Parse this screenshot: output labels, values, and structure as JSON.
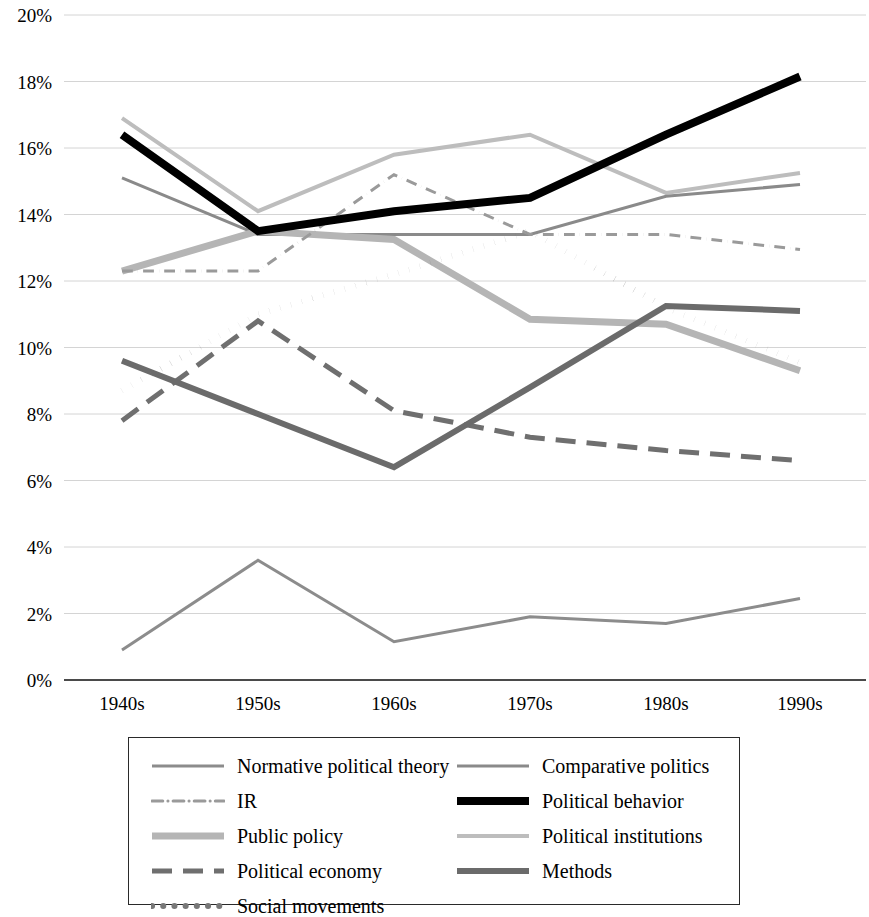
{
  "chart_data": {
    "type": "line",
    "title": "",
    "xlabel": "",
    "ylabel": "",
    "categories": [
      "1940s",
      "1950s",
      "1960s",
      "1970s",
      "1980s",
      "1990s"
    ],
    "ylim": [
      0,
      20
    ],
    "ytick_labels": [
      "0%",
      "2%",
      "4%",
      "6%",
      "8%",
      "10%",
      "12%",
      "14%",
      "16%",
      "18%",
      "20%"
    ],
    "ytick_values": [
      0,
      2,
      4,
      6,
      8,
      10,
      12,
      14,
      16,
      18,
      20
    ],
    "grid": true,
    "legend_position": "bottom",
    "value_suffix": "%",
    "series": [
      {
        "name": "Normative political theory",
        "values": [
          0.9,
          3.6,
          1.15,
          1.9,
          1.7,
          2.45
        ],
        "color": "#8c8c8c",
        "width": 3,
        "dash": "none"
      },
      {
        "name": "IR",
        "values": [
          12.3,
          12.3,
          15.2,
          13.4,
          13.4,
          12.95
        ],
        "color": "#9a9a9a",
        "width": 3,
        "dash": "dashdot"
      },
      {
        "name": "Public policy",
        "values": [
          12.3,
          13.5,
          13.25,
          10.85,
          10.7,
          9.3
        ],
        "color": "#b5b5b5",
        "width": 7,
        "dash": "none"
      },
      {
        "name": "Political economy",
        "values": [
          7.8,
          10.8,
          8.1,
          7.3,
          6.9,
          6.6
        ],
        "color": "#6f6f6f",
        "width": 5,
        "dash": "dashed"
      },
      {
        "name": "Social movements",
        "values": [
          8.7,
          11.0,
          12.2,
          13.5,
          11.2,
          9.55
        ],
        "color": "#787878",
        "width": 6,
        "dash": "dotted"
      },
      {
        "name": "Comparative politics",
        "values": [
          15.1,
          13.4,
          13.4,
          13.4,
          14.55,
          14.9
        ],
        "color": "#8a8a8a",
        "width": 3,
        "dash": "none"
      },
      {
        "name": "Political behavior",
        "values": [
          16.4,
          13.5,
          14.1,
          14.5,
          16.4,
          18.15
        ],
        "color": "#000000",
        "width": 8,
        "dash": "none"
      },
      {
        "name": "Political institutions",
        "values": [
          16.9,
          14.1,
          15.8,
          16.4,
          14.65,
          15.25
        ],
        "color": "#bdbdbd",
        "width": 4,
        "dash": "none"
      },
      {
        "name": "Methods",
        "values": [
          9.6,
          8.0,
          6.4,
          8.8,
          11.25,
          11.1
        ],
        "color": "#6b6b6b",
        "width": 6,
        "dash": "none"
      }
    ],
    "legend_order": [
      "Normative political theory",
      "Comparative politics",
      "IR",
      "Political behavior",
      "Public policy",
      "Political institutions",
      "Political economy",
      "Methods",
      "Social movements"
    ]
  }
}
